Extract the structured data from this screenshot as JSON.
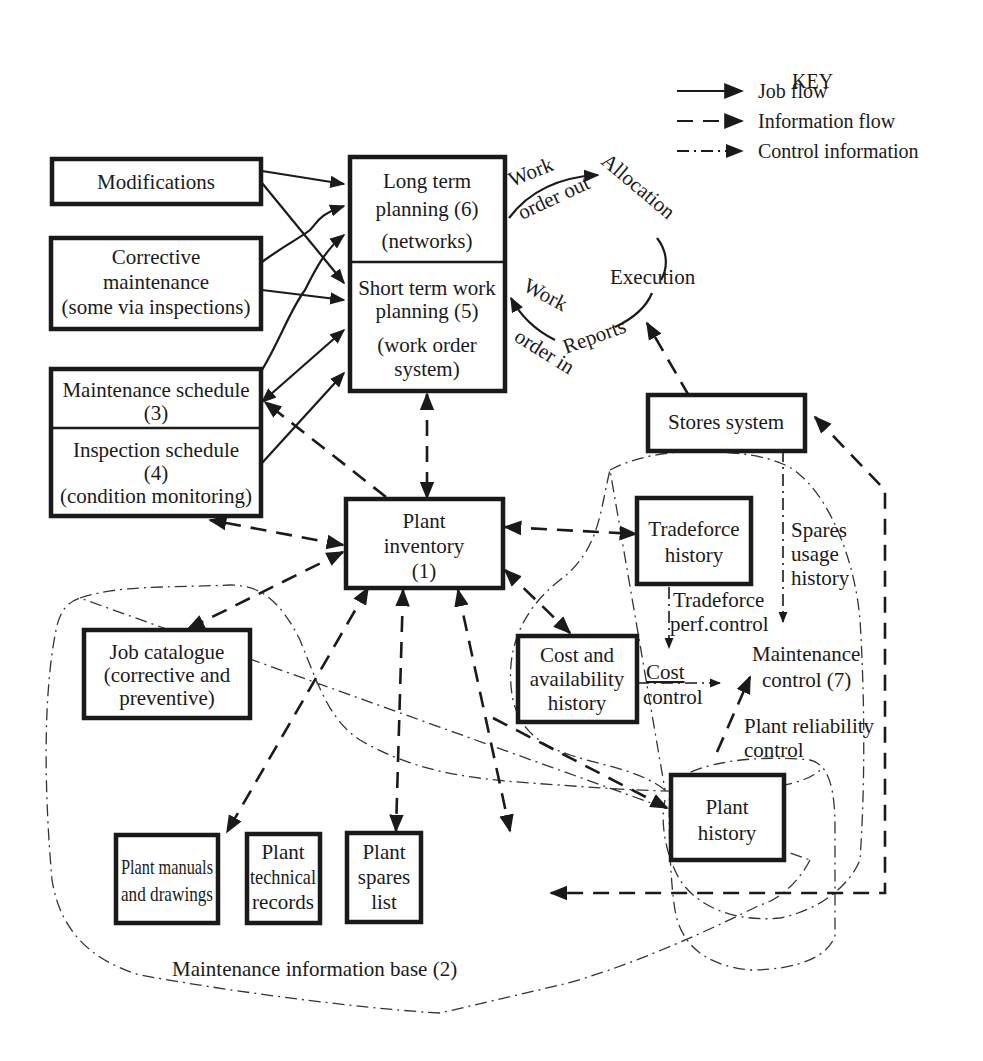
{
  "key": {
    "title": "KEY",
    "items": [
      {
        "style": "solid",
        "label": "Job flow"
      },
      {
        "style": "dashed",
        "label": "Information flow"
      },
      {
        "style": "dash-dot",
        "label": "Control information"
      }
    ]
  },
  "boxes": {
    "modifications": {
      "lines": [
        "Modifications"
      ]
    },
    "corrective": {
      "lines": [
        "Corrective",
        "maintenance",
        "(some via inspections)"
      ]
    },
    "maint_schedule": {
      "lines": [
        "Maintenance schedule",
        "(3)"
      ]
    },
    "inspection_schedule": {
      "lines": [
        "Inspection schedule",
        "(4)",
        "(condition monitoring)"
      ]
    },
    "long_term": {
      "lines": [
        "Long term",
        "planning (6)",
        "(networks)"
      ]
    },
    "short_term": {
      "lines": [
        "Short term work",
        "planning (5)",
        "(work order",
        "system)"
      ]
    },
    "stores": {
      "lines": [
        "Stores system"
      ]
    },
    "plant_inventory": {
      "lines": [
        "Plant",
        "inventory",
        "(1)"
      ]
    },
    "tradeforce": {
      "lines": [
        "Tradeforce",
        "history"
      ]
    },
    "cost_avail": {
      "lines": [
        "Cost and",
        "availability",
        "history"
      ]
    },
    "job_catalogue": {
      "lines": [
        "Job catalogue",
        "(corrective and",
        "preventive)"
      ]
    },
    "plant_history": {
      "lines": [
        "Plant",
        "history"
      ]
    },
    "manuals": {
      "lines": [
        "Plant manuals",
        "and drawings"
      ]
    },
    "tech_records": {
      "lines": [
        "Plant",
        "technical",
        "records"
      ]
    },
    "spares_list": {
      "lines": [
        "Plant",
        "spares",
        "list"
      ]
    }
  },
  "cycle": {
    "allocation": "Allocation",
    "execution": "Execution",
    "reports": "Reports",
    "work_out_1": "Work",
    "work_out_2": "order out",
    "work_in_1": "Work",
    "work_in_2": "order in"
  },
  "labels": {
    "spares_usage": [
      "Spares",
      "usage",
      "history"
    ],
    "tradeforce_perf": [
      "Tradeforce",
      "perf.control"
    ],
    "cost_control": [
      "Cost",
      "control"
    ],
    "maint_control": [
      "Maintenance",
      "control (7)"
    ],
    "plant_reliability": [
      "Plant reliability",
      "control"
    ],
    "info_base": "Maintenance information base (2)"
  }
}
